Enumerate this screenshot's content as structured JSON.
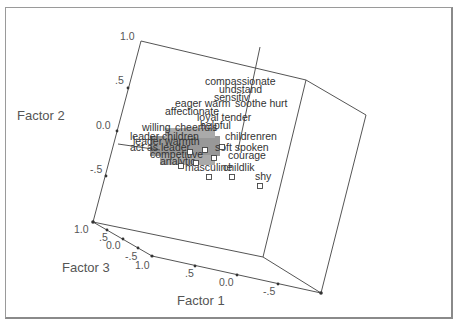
{
  "chart_data": {
    "type": "scatter",
    "subtype": "3d-scatter",
    "title": "",
    "axes": {
      "x": {
        "label": "Factor 1",
        "ticks": [
          "1.0",
          ".5",
          "0.0",
          "-.5"
        ]
      },
      "y": {
        "label": "Factor 2",
        "ticks": [
          "1.0",
          ".5",
          "0.0",
          "-.5"
        ]
      },
      "z": {
        "label": "Factor 3",
        "ticks": [
          "1.0",
          ".5",
          "0.0",
          "-.5"
        ]
      }
    },
    "legend": null,
    "grid": false,
    "points": [
      {
        "label": "compassionate",
        "x": 0.05,
        "y": 0.55,
        "z": 0.1
      },
      {
        "label": "understand",
        "x": 0.1,
        "y": 0.5,
        "z": 0.1
      },
      {
        "label": "sensitive",
        "x": 0.05,
        "y": 0.45,
        "z": 0.1
      },
      {
        "label": "soothe hurt",
        "x": 0.05,
        "y": 0.4,
        "z": 0.05
      },
      {
        "label": "eager",
        "x": 0.3,
        "y": 0.38,
        "z": 0.1
      },
      {
        "label": "warm",
        "x": 0.2,
        "y": 0.38,
        "z": 0.1
      },
      {
        "label": "affectionate",
        "x": 0.3,
        "y": 0.32,
        "z": 0.1
      },
      {
        "label": "loyal",
        "x": 0.15,
        "y": 0.28,
        "z": 0.1
      },
      {
        "label": "tender",
        "x": 0.15,
        "y": 0.26,
        "z": 0.1
      },
      {
        "label": "helpful",
        "x": 0.1,
        "y": 0.2,
        "z": 0.1
      },
      {
        "label": "willing",
        "x": 0.45,
        "y": 0.12,
        "z": 0.1
      },
      {
        "label": "cheerful",
        "x": 0.05,
        "y": 0.12,
        "z": 0.1
      },
      {
        "label": "children",
        "x": 0.0,
        "y": 0.08,
        "z": 0.1
      },
      {
        "label": "leader",
        "x": 0.55,
        "y": 0.05,
        "z": 0.1
      },
      {
        "label": "soft spoken",
        "x": -0.05,
        "y": -0.02,
        "z": 0.1
      },
      {
        "label": "act as leader",
        "x": 0.5,
        "y": -0.05,
        "z": 0.1
      },
      {
        "label": "courage",
        "x": 0.35,
        "y": -0.12,
        "z": 0.1
      },
      {
        "label": "courage",
        "x": -0.05,
        "y": -0.1,
        "z": 0.1
      },
      {
        "label": "masculine",
        "x": 0.15,
        "y": -0.22,
        "z": 0.1
      },
      {
        "label": "childlik",
        "x": 0.05,
        "y": -0.22,
        "z": 0.1
      },
      {
        "label": "shy",
        "x": -0.15,
        "y": -0.3,
        "z": 0.1
      }
    ]
  },
  "axis_titles": {
    "factor1": "Factor 1",
    "factor2": "Factor 2",
    "factor3": "Factor 3"
  },
  "ticks": {
    "factor2": [
      "1.0",
      ".5",
      "0.0",
      "-.5"
    ],
    "factor3": [
      "1.0",
      ".5",
      "0.0",
      "-.5",
      "1.0"
    ],
    "factor1": [
      ".5",
      "0.0",
      "-.5"
    ]
  },
  "labels": [
    {
      "text": "compassionate",
      "x": 205,
      "y": 85
    },
    {
      "text": "undstand",
      "x": 219,
      "y": 93
    },
    {
      "text": "sensitiv",
      "x": 214,
      "y": 101
    },
    {
      "text": "soothe hurt",
      "x": 235,
      "y": 107
    },
    {
      "text": "eager warm",
      "x": 175,
      "y": 107
    },
    {
      "text": "affectionate",
      "x": 165,
      "y": 115
    },
    {
      "text": "loyal tender",
      "x": 197,
      "y": 121
    },
    {
      "text": "helpful",
      "x": 200,
      "y": 129
    },
    {
      "text": "willing",
      "x": 142,
      "y": 131
    },
    {
      "text": "cheerfuls",
      "x": 175,
      "y": 131
    },
    {
      "text": "leader children",
      "x": 130,
      "y": 140
    },
    {
      "text": "childrenren",
      "x": 225,
      "y": 140
    },
    {
      "text": "leader warmth",
      "x": 133,
      "y": 145
    },
    {
      "text": "soft spoken",
      "x": 215,
      "y": 151
    },
    {
      "text": "act as leader",
      "x": 130,
      "y": 151
    },
    {
      "text": "courage",
      "x": 228,
      "y": 159
    },
    {
      "text": "competitive",
      "x": 150,
      "y": 158
    },
    {
      "text": "analytic",
      "x": 160,
      "y": 165
    },
    {
      "text": "masculine",
      "x": 185,
      "y": 171
    },
    {
      "text": "childlik",
      "x": 223,
      "y": 171
    },
    {
      "text": "shy",
      "x": 255,
      "y": 180
    }
  ],
  "markers": [
    {
      "x": 181,
      "y": 166
    },
    {
      "x": 209,
      "y": 177
    },
    {
      "x": 232,
      "y": 177
    },
    {
      "x": 260,
      "y": 186
    },
    {
      "x": 196,
      "y": 163
    },
    {
      "x": 214,
      "y": 158
    },
    {
      "x": 222,
      "y": 147
    },
    {
      "x": 205,
      "y": 150
    },
    {
      "x": 190,
      "y": 152
    }
  ]
}
